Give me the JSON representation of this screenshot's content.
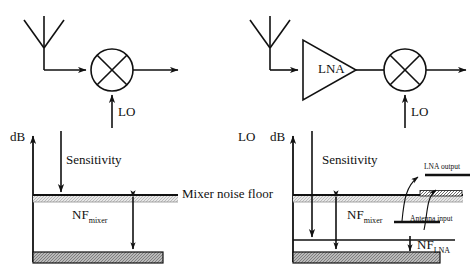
{
  "figure": {
    "type": "diagram",
    "panels": [
      {
        "id": "left",
        "name": "mixer-only-receiver",
        "circuit": {
          "antenna_label": "",
          "blocks": [
            "mixer"
          ],
          "mixer_symbol": "circle-with-x",
          "lo_label": "LO",
          "output_arrow": true
        },
        "graph": {
          "y_axis_label": "dB",
          "sensitivity_label": "Sensitivity",
          "noise_floor_label": "Mixer noise floor",
          "nf_label_main": "NF",
          "nf_label_sub": "mixer",
          "floor_fill": "hatched-gray"
        }
      },
      {
        "id": "right",
        "name": "lna-plus-mixer-receiver",
        "circuit": {
          "antenna_label": "",
          "blocks": [
            "lna",
            "mixer"
          ],
          "lna_label": "LNA",
          "mixer_symbol": "circle-with-x",
          "lo_label": "LO",
          "output_arrow": true
        },
        "graph": {
          "lo_side_label": "LO",
          "y_axis_label": "dB",
          "sensitivity_label": "Sensitivity",
          "nf_label_main": "NF",
          "nf_label_sub": "mixer",
          "nf_lna_main": "NF",
          "nf_lna_sub": "LNA",
          "lna_output_label": "LNA output",
          "antenna_input_label": "Antenna input",
          "floor_fill": "hatched-gray"
        }
      }
    ]
  },
  "colors": {
    "stroke": "#111111",
    "floor_fill": "#b4b4b4",
    "noise_band": "#dcdcdc",
    "background": "#ffffff"
  }
}
